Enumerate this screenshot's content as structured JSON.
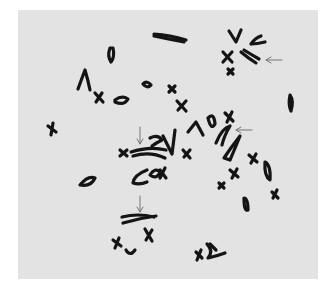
{
  "figure": {
    "type": "metaphase chromosome spread micrograph",
    "background_color": "#ffffff",
    "plate_color": "#e3e3e3",
    "chromosome_color": "#141414",
    "arrow_color": "#6a6a6a",
    "plate": {
      "x": 18,
      "y": 10,
      "w": 300,
      "h": 269
    }
  },
  "chromosomes": [
    {
      "id": "long-v-top",
      "d": "M154 34 Q170 35 186 40 M154 36 Q168 39 184 42"
    },
    {
      "id": "oval-top-left",
      "d": "M110 48 Q107 56 111 62 Q115 57 113 48 Z"
    },
    {
      "id": "v-top-right",
      "d": "M229 31 L236 42 L241 30"
    },
    {
      "id": "u-top-right",
      "d": "M251 44 Q255 38 261 36 M251 44 Q257 44 265 42"
    },
    {
      "id": "x-top-right",
      "d": "M223 52 L232 62 M232 52 L223 62"
    },
    {
      "id": "x-small-top-right",
      "d": "M228 69 L233 74 M233 69 L228 74"
    },
    {
      "id": "pair-top-right-arrowed",
      "d": "M241 52 Q248 58 256 63 M244 50 Q252 55 259 59"
    },
    {
      "id": "lambda-left",
      "d": "M78 89 Q82 78 85 70 Q88 80 90 90"
    },
    {
      "id": "x-left",
      "d": "M95 93 L103 102 M102 93 L96 102"
    },
    {
      "id": "ring-left",
      "d": "M115 100 Q122 95 128 99 Q124 106 115 102 Z"
    },
    {
      "id": "oval-small-mid",
      "d": "M143 84 Q147 80 151 85 Q147 89 143 84 Z"
    },
    {
      "id": "x-small-mid",
      "d": "M169 86 L175 92 M175 86 L169 92"
    },
    {
      "id": "x-mid-right",
      "d": "M177 101 L186 111 M186 101 L178 110"
    },
    {
      "id": "oval-right-edge",
      "d": "M290 95 Q294 101 291 111 Q288 105 290 95 Z"
    },
    {
      "id": "x-far-left",
      "d": "M48 126 L56 132 M53 123 L51 135"
    },
    {
      "id": "x-center-left",
      "d": "M120 150 L127 156 M127 150 L120 156"
    },
    {
      "id": "pair-center-arrowed",
      "d": "M131 152 Q150 146 166 150 M133 156 Q150 151 165 158"
    },
    {
      "id": "hook-center",
      "d": "M150 138 Q158 134 162 140 Q156 143 152 146"
    },
    {
      "id": "v-center",
      "d": "M163 136 L172 154 L175 130"
    },
    {
      "id": "lambda-center",
      "d": "M188 132 L196 122 L203 135"
    },
    {
      "id": "x-center",
      "d": "M183 150 L190 158 M190 150 L184 157"
    },
    {
      "id": "oval-center-right",
      "d": "M208 118 Q214 112 215 124 Q211 131 208 118 Z"
    },
    {
      "id": "x-center-right-top",
      "d": "M225 113 L233 121 M232 112 L227 122"
    },
    {
      "id": "u-center-right",
      "d": "M216 143 Q222 128 230 126 Q224 136 222 145"
    },
    {
      "id": "long-pair-center-right",
      "d": "M224 158 Q232 146 240 136 Q236 146 230 160 Z"
    },
    {
      "id": "x-right-mid",
      "d": "M249 155 L257 162 M256 154 L251 163"
    },
    {
      "id": "oval-right-mid",
      "d": "M265 162 Q271 165 270 180 Q264 176 265 162 Z"
    },
    {
      "id": "x-right-low",
      "d": "M230 170 L238 177 M237 169 L232 178"
    },
    {
      "id": "x-small-right-low",
      "d": "M219 183 L224 188 M224 183 L219 188"
    },
    {
      "id": "oval-left-mid",
      "d": "M80 185 Q88 175 95 178 Q91 187 80 185 Z"
    },
    {
      "id": "c-center-low",
      "d": "M147 170 Q134 175 133 183 Q140 185 147 182"
    },
    {
      "id": "ring-x-center-low",
      "d": "M150 175 Q155 167 160 172 Q157 180 150 175 Z M160 170 L166 178 M165 168 L160 178"
    },
    {
      "id": "x-right-lower",
      "d": "M272 192 L278 198 M277 190 L273 198"
    },
    {
      "id": "oval-lower-right",
      "d": "M244 198 Q248 198 248 210 Q244 212 244 198 Z"
    },
    {
      "id": "pair-lower-arrowed",
      "d": "M122 217 Q138 213 154 217 M123 223 Q140 218 156 216"
    },
    {
      "id": "x-lower-center",
      "d": "M145 229 L152 241 M152 230 L146 240"
    },
    {
      "id": "x-lower-left",
      "d": "M113 240 L121 246 M119 238 L115 248"
    },
    {
      "id": "u-lower-left",
      "d": "M126 250 Q130 257 135 250"
    },
    {
      "id": "x-lower-mid-right",
      "d": "M196 252 L202 258 M201 250 L197 260"
    },
    {
      "id": "hook-lower-right",
      "d": "M207 244 Q214 251 208 258 Q217 256 225 253 M210 244 L216 250"
    }
  ],
  "arrows": [
    {
      "id": "arrow-top-right",
      "x1": 282,
      "y1": 60,
      "x2": 266,
      "y2": 60,
      "direction": "left"
    },
    {
      "id": "arrow-center-right",
      "x1": 252,
      "y1": 130,
      "x2": 236,
      "y2": 130,
      "direction": "left"
    },
    {
      "id": "arrow-center-left",
      "x1": 140,
      "y1": 127,
      "x2": 140,
      "y2": 144,
      "direction": "down"
    },
    {
      "id": "arrow-lower-left",
      "x1": 140,
      "y1": 196,
      "x2": 140,
      "y2": 212,
      "direction": "down"
    }
  ]
}
